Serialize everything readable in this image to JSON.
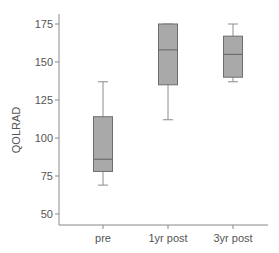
{
  "chart_data": {
    "type": "boxplot",
    "title": "",
    "xlabel": "",
    "ylabel": "QOLRAD",
    "ylim": [
      42,
      180
    ],
    "yticks": [
      50,
      75,
      100,
      125,
      150,
      175
    ],
    "ytick_labels": [
      "50",
      "75",
      "100",
      "125",
      "150",
      "175"
    ],
    "categories": [
      "pre",
      "1yr post",
      "3yr post"
    ],
    "grid": false,
    "legend": null,
    "boxes": [
      {
        "category": "pre",
        "whisker_low": 69,
        "q1": 78,
        "median": 86,
        "q3": 114,
        "whisker_high": 137
      },
      {
        "category": "1yr post",
        "whisker_low": 112,
        "q1": 135,
        "median": 158,
        "q3": 175,
        "whisker_high": 175
      },
      {
        "category": "3yr post",
        "whisker_low": 137,
        "q1": 140,
        "median": 155,
        "q3": 167,
        "whisker_high": 175
      }
    ],
    "colors": {
      "box_fill": "#a9a9a9",
      "box_stroke": "#6e6e6e",
      "whisker": "#8c8c8c",
      "axis": "#888888",
      "text": "#555555"
    }
  }
}
